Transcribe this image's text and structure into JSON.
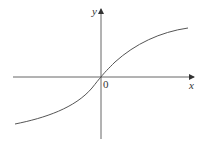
{
  "diagram": {
    "type": "function-graph",
    "axes": {
      "x_label": "x",
      "y_label": "y",
      "origin_label": "0"
    },
    "curve": {
      "description": "increasing curve passing through the origin, concave up for x<0 and concave down for x>0 (arctan-like)",
      "color": "#555555"
    },
    "colors": {
      "axis": "#555555",
      "background": "#ffffff"
    }
  }
}
